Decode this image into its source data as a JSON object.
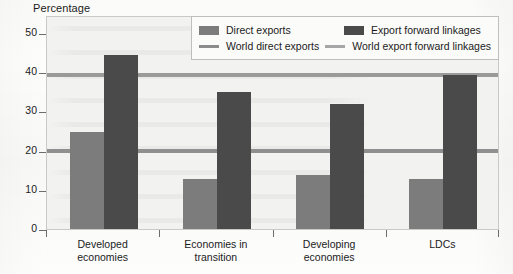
{
  "axis_title": "Percentage",
  "legend": {
    "entries": [
      {
        "name": "direct-exports",
        "label": "Direct exports",
        "marker": "swatch",
        "color": "#7c7c7c"
      },
      {
        "name": "export-forward-linkages",
        "label": "Export forward linkages",
        "marker": "swatch",
        "color": "#4a4a4a"
      },
      {
        "name": "world-direct-exports",
        "label": "World direct exports",
        "marker": "line",
        "color": "#8c8c8c"
      },
      {
        "name": "world-export-forward-linkages",
        "label": "World export forward linkages",
        "marker": "line",
        "color": "#a6a6a6"
      }
    ]
  },
  "chart_data": {
    "type": "bar",
    "title": "",
    "xlabel": "",
    "ylabel": "Percentage",
    "ylim": [
      0,
      50
    ],
    "yticks": [
      0,
      10,
      20,
      30,
      40,
      50
    ],
    "ytick_labels": [
      "0",
      "10",
      "20",
      "30",
      "40",
      "50"
    ],
    "grid": false,
    "legend_position": "top-right",
    "categories": [
      "Developed economies",
      "Economies in transition",
      "Developing economies",
      "LDCs"
    ],
    "category_lines": [
      [
        "Developed",
        "economies"
      ],
      [
        "Economies in",
        "transition"
      ],
      [
        "Developing",
        "economies"
      ],
      [
        "LDCs",
        ""
      ]
    ],
    "series": [
      {
        "name": "Direct exports",
        "color": "#7c7c7c",
        "values": [
          24.8,
          12.7,
          13.8,
          12.8
        ]
      },
      {
        "name": "Export forward linkages",
        "color": "#4a4a4a",
        "values": [
          44.3,
          35.0,
          32.0,
          39.3
        ]
      }
    ],
    "reference_lines": [
      {
        "name": "World export forward linkages",
        "value": 39.3,
        "color": "#9a9a9a"
      },
      {
        "name": "World direct exports",
        "value": 19.9,
        "color": "#8f8f8f"
      }
    ]
  }
}
